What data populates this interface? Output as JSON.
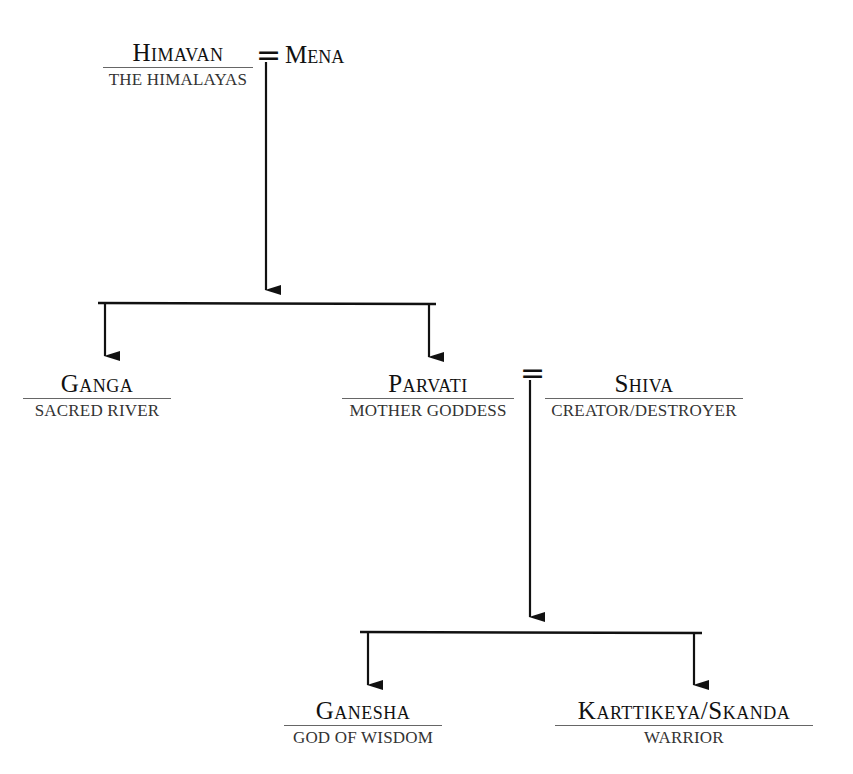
{
  "diagram": {
    "type": "family-tree",
    "generations": [
      {
        "couple": {
          "left": {
            "name": "Himavan",
            "role": "THE HIMALAYAS"
          },
          "marriage_symbol": "=",
          "right": {
            "name": "Mena",
            "role": ""
          }
        }
      },
      {
        "children": [
          {
            "name": "Ganga",
            "role": "SACRED RIVER"
          },
          {
            "name": "Parvati",
            "role": "MOTHER GODDESS"
          }
        ],
        "couple": {
          "left": {
            "name": "Parvati",
            "role": "MOTHER GODDESS"
          },
          "marriage_symbol": "=",
          "right": {
            "name": "Shiva",
            "role": "CREATOR/DESTROYER"
          }
        }
      },
      {
        "children": [
          {
            "name": "Ganesha",
            "role": "GOD OF WISDOM"
          },
          {
            "name": "Karttikeya/Skanda",
            "role": "WARRIOR"
          }
        ]
      }
    ],
    "edges": [
      {
        "from": "Himavan = Mena",
        "to": [
          "Ganga",
          "Parvati"
        ]
      },
      {
        "from": "Parvati = Shiva",
        "to": [
          "Ganesha",
          "Karttikeya/Skanda"
        ]
      }
    ]
  },
  "labels": {
    "himavan": {
      "name": "Himavan",
      "role": "THE HIMALAYAS"
    },
    "mena": {
      "name": "Mena"
    },
    "ganga": {
      "name": "Ganga",
      "role": "SACRED RIVER"
    },
    "parvati": {
      "name": "Parvati",
      "role": "MOTHER GODDESS"
    },
    "shiva": {
      "name": "Shiva",
      "role": "CREATOR/DESTROYER"
    },
    "ganesha": {
      "name": "Ganesha",
      "role": "GOD OF WISDOM"
    },
    "karttikeya": {
      "name": "Karttikeya/Skanda",
      "role": "WARRIOR"
    },
    "marriage_symbol": "="
  },
  "colors": {
    "line": "#111111",
    "rule": "#666666",
    "role_text": "#333333"
  }
}
